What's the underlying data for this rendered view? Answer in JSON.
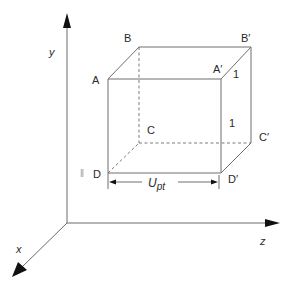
{
  "figure": {
    "type": "3d-cube-coordinate-diagram",
    "axes": {
      "y_label": "y",
      "x_label": "x",
      "z_label": "z"
    },
    "vertices": {
      "A": "A",
      "B": "B",
      "C": "C",
      "D": "D",
      "A_prime": "A′",
      "B_prime": "B′",
      "C_prime": "C′",
      "D_prime": "D′"
    },
    "edge_labels": {
      "top_depth": "1",
      "right_height": "1"
    },
    "dimension": {
      "label_main": "U",
      "label_sub": "pt"
    },
    "stray_mark": "ǁ",
    "colors": {
      "edge": "#6e6e6e",
      "axis": "#6a6a6a",
      "arrowhead": "#111111",
      "text": "#2a2a2a"
    }
  }
}
